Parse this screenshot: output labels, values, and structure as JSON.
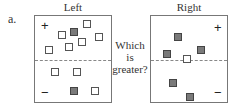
{
  "item_label": "a.",
  "question": {
    "line1": "Which",
    "line2": "is",
    "line3": "greater?"
  },
  "panels": {
    "left": {
      "title": "Left",
      "plus": "+",
      "minus": "−",
      "top_squares": [
        {
          "x": 48,
          "y": 4,
          "type": "open"
        },
        {
          "x": 23,
          "y": 15,
          "type": "open"
        },
        {
          "x": 35,
          "y": 12,
          "type": "filled"
        },
        {
          "x": 60,
          "y": 17,
          "type": "open"
        },
        {
          "x": 43,
          "y": 22,
          "type": "open"
        },
        {
          "x": 30,
          "y": 27,
          "type": "open"
        },
        {
          "x": 10,
          "y": 30,
          "type": "open"
        }
      ],
      "bottom_squares": [
        {
          "x": 16,
          "y": 52,
          "type": "open"
        },
        {
          "x": 38,
          "y": 52,
          "type": "open"
        },
        {
          "x": 35,
          "y": 71,
          "type": "filled"
        },
        {
          "x": 56,
          "y": 71,
          "type": "open"
        }
      ]
    },
    "right": {
      "title": "Right",
      "plus": "+",
      "minus": "−",
      "top_squares": [
        {
          "x": 23,
          "y": 17,
          "type": "filled"
        },
        {
          "x": 12,
          "y": 34,
          "type": "filled"
        },
        {
          "x": 46,
          "y": 30,
          "type": "filled"
        },
        {
          "x": 32,
          "y": 39,
          "type": "open"
        }
      ],
      "bottom_squares": [
        {
          "x": 18,
          "y": 63,
          "type": "filled"
        },
        {
          "x": 35,
          "y": 77,
          "type": "filled"
        }
      ]
    }
  }
}
